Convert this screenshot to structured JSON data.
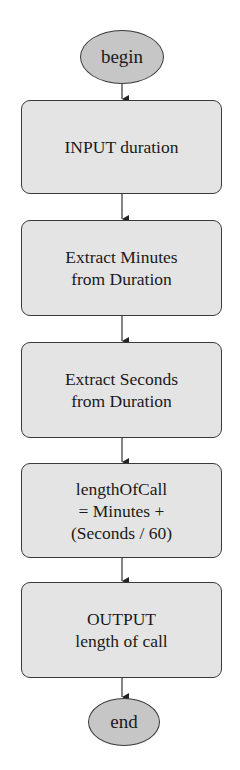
{
  "diagram": {
    "type": "flowchart",
    "start": {
      "label": "begin"
    },
    "steps": [
      {
        "lines": [
          "INPUT duration"
        ]
      },
      {
        "lines": [
          "Extract Minutes",
          "from Duration"
        ]
      },
      {
        "lines": [
          "Extract Seconds",
          "from Duration"
        ]
      },
      {
        "lines": [
          "lengthOfCall",
          "= Minutes +",
          "(Seconds / 60)"
        ]
      },
      {
        "lines": [
          "OUTPUT",
          "length of call"
        ]
      }
    ],
    "end": {
      "label": "end"
    },
    "colors": {
      "terminal_fill": "#c6c6c6",
      "process_fill": "#e4e4e4",
      "stroke": "#3a3a3a"
    }
  }
}
